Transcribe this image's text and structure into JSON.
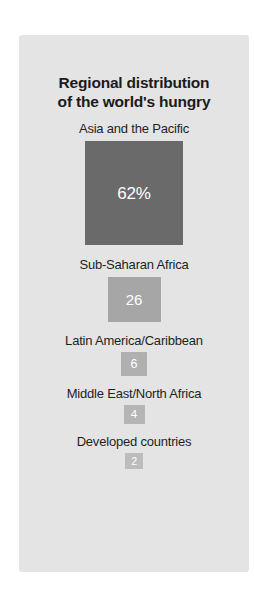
{
  "figure": {
    "title_line_1": "Regional distribution",
    "title_line_2": "of the world's hungry",
    "panel_background": "#e4e4e4",
    "page_background": "#ffffff"
  },
  "chart_data": {
    "type": "bar",
    "title": "Regional distribution of the world's hungry",
    "subtitle": "",
    "xlabel": "",
    "ylabel": "",
    "unit": "percent",
    "categories": [
      "Asia and the Pacific",
      "Sub-Saharan Africa",
      "Latin America/Caribbean",
      "Middle East/North Africa",
      "Developed countries"
    ],
    "values": [
      62,
      26,
      6,
      4,
      2
    ],
    "value_labels": [
      "62%",
      "26",
      "6",
      "4",
      "2"
    ],
    "colors": [
      "#6a6a6a",
      "#a6a6a6",
      "#b0b0b0",
      "#b5b5b5",
      "#bcbcbc"
    ],
    "legend": "none",
    "grid": false,
    "annotations": [
      "Proportional area squares, value shown inside each square"
    ]
  }
}
